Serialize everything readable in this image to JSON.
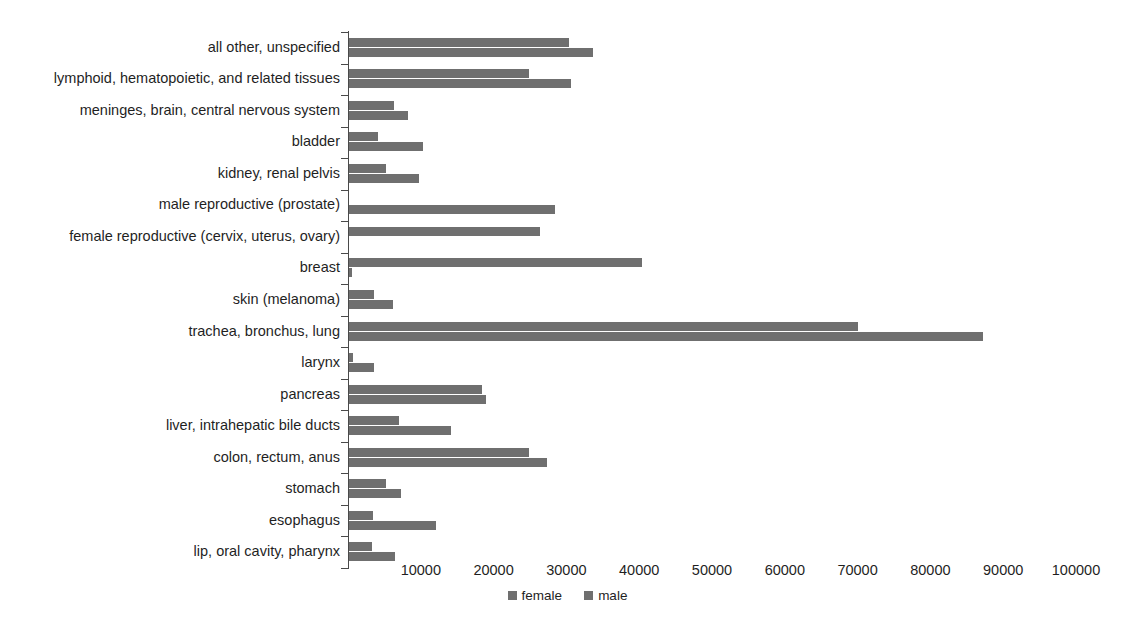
{
  "chart_data": {
    "type": "bar",
    "orientation": "horizontal",
    "title": "",
    "xlabel": "",
    "ylabel": "",
    "xlim": [
      0,
      103000
    ],
    "xticks": [
      "10000",
      "20000",
      "30000",
      "40000",
      "50000",
      "60000",
      "70000",
      "80000",
      "90000",
      "100000"
    ],
    "xtick_values": [
      10000,
      20000,
      30000,
      40000,
      50000,
      60000,
      70000,
      80000,
      90000,
      100000
    ],
    "grid": false,
    "legend_position": "bottom",
    "categories": [
      "all other, unspecified",
      "lymphoid, hematopoietic, and related tissues",
      "meninges, brain, central nervous system",
      "bladder",
      "kidney, renal pelvis",
      "male reproductive (prostate)",
      "female reproductive (cervix, uterus, ovary)",
      "breast",
      "skin (melanoma)",
      "trachea, bronchus, lung",
      "larynx",
      "pancreas",
      "liver, intrahepatic bile ducts",
      "colon, rectum, anus",
      "stomach",
      "esophagus",
      "lip, oral cavity, pharynx"
    ],
    "series": [
      {
        "name": "female",
        "color": "#6f6f6f",
        "values": [
          30200,
          24700,
          6200,
          4000,
          5100,
          0,
          26200,
          40300,
          3400,
          69900,
          500,
          18300,
          6900,
          24700,
          5100,
          3300,
          3200
        ]
      },
      {
        "name": "male",
        "color": "#6f6f6f",
        "values": [
          33500,
          30500,
          8100,
          10200,
          9600,
          28300,
          0,
          400,
          6000,
          87100,
          3400,
          18800,
          14000,
          27200,
          7100,
          11900,
          6300
        ]
      }
    ]
  },
  "legend": {
    "items": [
      {
        "label": "female",
        "color": "#6f6f6f"
      },
      {
        "label": "male",
        "color": "#6f6f6f"
      }
    ]
  },
  "axis": {
    "y_axis_color": "#4a4a4a",
    "tick_color": "#4a4a4a"
  }
}
